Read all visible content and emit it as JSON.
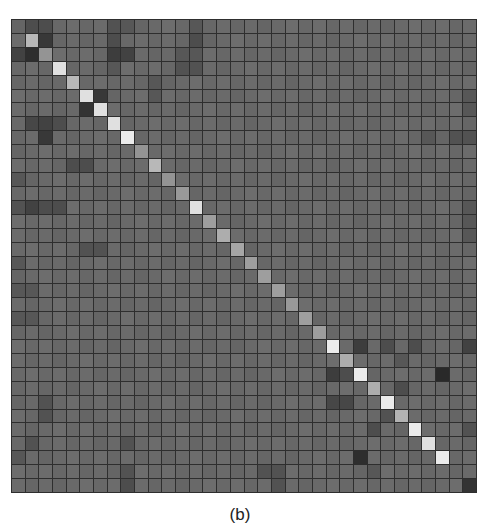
{
  "caption": "(b)",
  "chart_data": {
    "type": "heatmap",
    "title": "",
    "caption": "(b)",
    "rows": 34,
    "cols": 34,
    "xlabel": "",
    "ylabel": "",
    "colormap": "grayscale (dark = low, light = high)",
    "grid": true,
    "background_level": 105,
    "diagonal": {
      "start_index": 1,
      "end_index": 31,
      "values": [
        0.72,
        0.58,
        0.88,
        0.72,
        0.88,
        0.88,
        0.88,
        0.92,
        0.58,
        0.72,
        0.58,
        0.6,
        0.88,
        0.62,
        0.68,
        0.65,
        0.62,
        0.62,
        0.62,
        0.6,
        0.62,
        0.62,
        0.92,
        0.68,
        0.92,
        0.68,
        0.92,
        0.7,
        0.92,
        0.88,
        0.92
      ]
    },
    "dark_cells": [
      [
        0,
        1,
        0.3
      ],
      [
        0,
        2,
        0.3
      ],
      [
        0,
        7,
        0.32
      ],
      [
        0,
        8,
        0.34
      ],
      [
        0,
        13,
        0.34
      ],
      [
        1,
        2,
        0.22
      ],
      [
        1,
        7,
        0.3
      ],
      [
        1,
        13,
        0.3
      ],
      [
        2,
        0,
        0.26
      ],
      [
        2,
        1,
        0.18
      ],
      [
        2,
        7,
        0.24
      ],
      [
        2,
        8,
        0.26
      ],
      [
        2,
        12,
        0.34
      ],
      [
        2,
        13,
        0.34
      ],
      [
        3,
        12,
        0.32
      ],
      [
        3,
        13,
        0.32
      ],
      [
        3,
        7,
        0.34
      ],
      [
        4,
        10,
        0.34
      ],
      [
        5,
        6,
        0.22
      ],
      [
        5,
        10,
        0.34
      ],
      [
        5,
        33,
        0.34
      ],
      [
        6,
        5,
        0.2
      ],
      [
        6,
        33,
        0.34
      ],
      [
        7,
        1,
        0.28
      ],
      [
        7,
        2,
        0.26
      ],
      [
        7,
        3,
        0.3
      ],
      [
        8,
        2,
        0.22
      ],
      [
        8,
        30,
        0.34
      ],
      [
        8,
        32,
        0.32
      ],
      [
        8,
        33,
        0.32
      ],
      [
        10,
        4,
        0.3
      ],
      [
        10,
        5,
        0.3
      ],
      [
        11,
        0,
        0.34
      ],
      [
        13,
        0,
        0.32
      ],
      [
        13,
        1,
        0.26
      ],
      [
        13,
        2,
        0.3
      ],
      [
        13,
        3,
        0.3
      ],
      [
        13,
        33,
        0.34
      ],
      [
        14,
        33,
        0.34
      ],
      [
        15,
        33,
        0.34
      ],
      [
        16,
        5,
        0.32
      ],
      [
        16,
        6,
        0.32
      ],
      [
        17,
        0,
        0.34
      ],
      [
        19,
        0,
        0.34
      ],
      [
        19,
        1,
        0.34
      ],
      [
        21,
        0,
        0.34
      ],
      [
        21,
        1,
        0.34
      ],
      [
        27,
        2,
        0.32
      ],
      [
        28,
        2,
        0.32
      ],
      [
        30,
        1,
        0.32
      ],
      [
        30,
        8,
        0.32
      ],
      [
        31,
        0,
        0.34
      ],
      [
        32,
        8,
        0.32
      ],
      [
        33,
        8,
        0.3
      ],
      [
        23,
        25,
        0.24
      ],
      [
        23,
        27,
        0.3
      ],
      [
        23,
        29,
        0.3
      ],
      [
        23,
        33,
        0.26
      ],
      [
        24,
        28,
        0.34
      ],
      [
        25,
        23,
        0.24
      ],
      [
        25,
        24,
        0.3
      ],
      [
        25,
        31,
        0.16
      ],
      [
        26,
        28,
        0.3
      ],
      [
        27,
        23,
        0.28
      ],
      [
        27,
        24,
        0.28
      ],
      [
        28,
        27,
        0.32
      ],
      [
        29,
        26,
        0.3
      ],
      [
        29,
        33,
        0.32
      ],
      [
        31,
        25,
        0.18
      ],
      [
        32,
        18,
        0.32
      ],
      [
        32,
        19,
        0.32
      ],
      [
        32,
        26,
        0.34
      ],
      [
        33,
        19,
        0.32
      ],
      [
        33,
        33,
        0.2
      ]
    ]
  }
}
